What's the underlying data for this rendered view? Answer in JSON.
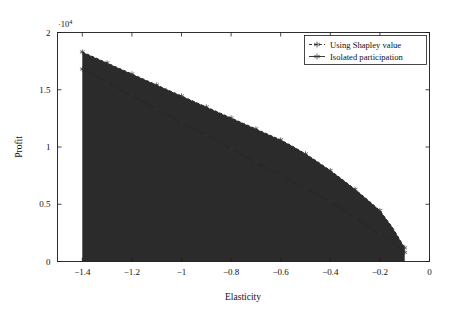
{
  "chart_data": {
    "type": "area",
    "title": "",
    "xlabel": "Elasticity",
    "ylabel": "Profit",
    "y_exponent_label": "·10",
    "y_exponent_power": "4",
    "xlim": [
      -1.5,
      0
    ],
    "ylim": [
      0,
      20000
    ],
    "grid": false,
    "legend_position": "top-right",
    "xticks": [
      -1.4,
      -1.2,
      -1,
      -0.8,
      -0.6,
      -0.4,
      -0.2,
      0
    ],
    "xticklabels": [
      "−1.4",
      "−1.2",
      "−1",
      "−0.8",
      "−0.6",
      "−0.4",
      "−0.2",
      "0"
    ],
    "yticks": [
      0,
      5000,
      10000,
      15000,
      20000
    ],
    "yticklabels": [
      "0",
      "0.5",
      "1",
      "1.5",
      "2"
    ],
    "x": [
      -1.4,
      -1.35,
      -1.3,
      -1.25,
      -1.2,
      -1.15,
      -1.1,
      -1.05,
      -1.0,
      -0.95,
      -0.9,
      -0.85,
      -0.8,
      -0.75,
      -0.7,
      -0.65,
      -0.6,
      -0.55,
      -0.5,
      -0.45,
      -0.4,
      -0.35,
      -0.3,
      -0.25,
      -0.2,
      -0.15,
      -0.1
    ],
    "series": [
      {
        "name": "Using Shapley value",
        "style": "dashed",
        "marker": "star",
        "color": "#262626",
        "values": [
          18300,
          17820,
          17340,
          16860,
          16380,
          15900,
          15420,
          14940,
          14460,
          13980,
          13500,
          13020,
          12540,
          12060,
          11580,
          11100,
          10620,
          10040,
          9400,
          8700,
          7950,
          7150,
          6300,
          5400,
          4450,
          3000,
          1200
        ]
      },
      {
        "name": "Isolated participation",
        "style": "solid",
        "marker": "star",
        "color": "#262626",
        "values": [
          16800,
          16220,
          15640,
          15060,
          14480,
          13900,
          13320,
          12740,
          12160,
          11580,
          11000,
          10420,
          9840,
          9260,
          8680,
          8100,
          7520,
          6960,
          6400,
          5800,
          5200,
          4550,
          3850,
          3100,
          2400,
          1700,
          800
        ]
      }
    ],
    "fill_between_color": "#2b2b2b",
    "area_fill_note": "region between the two curves and down to y=0 is filled dark"
  },
  "axes": {
    "frame_color": "#1a1a1a"
  }
}
